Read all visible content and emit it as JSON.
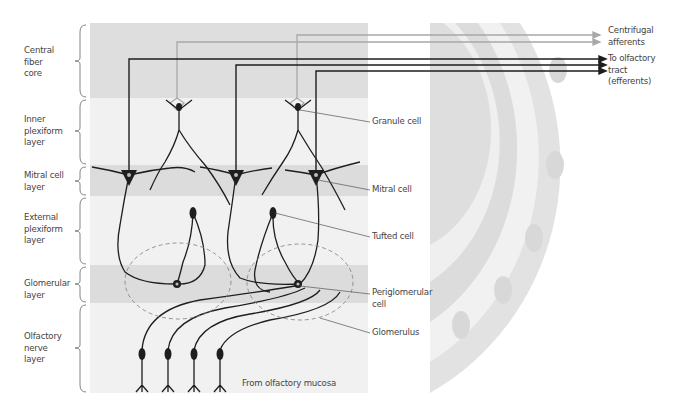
{
  "figure": {
    "colors": {
      "band_dark": "#dedede",
      "band_light": "#f1f1f1",
      "neuron": "#1e1e1e",
      "afferent": "#a8a8a8",
      "label": "#444444"
    }
  },
  "layers": [
    {
      "label": "Central\nfiber\ncore",
      "top": 23,
      "bottom": 98,
      "shade": "dark"
    },
    {
      "label": "Inner\nplexiform\nlayer",
      "top": 98,
      "bottom": 165,
      "shade": "light"
    },
    {
      "label": "Mitral cell\nlayer",
      "top": 165,
      "bottom": 196,
      "shade": "dark"
    },
    {
      "label": "External\nplexiform\nlayer",
      "top": 196,
      "bottom": 265,
      "shade": "light"
    },
    {
      "label": "Glomerular\nlayer",
      "top": 265,
      "bottom": 303,
      "shade": "dark"
    },
    {
      "label": "Olfactory\nnerve\nlayer",
      "top": 303,
      "bottom": 393,
      "shade": "light"
    }
  ],
  "callouts": {
    "granule_cell": "Granule cell",
    "mitral_cell": "Mitral cell",
    "tufted_cell": "Tufted cell",
    "periglomerular_cell": "Periglomerular\ncell",
    "glomerulus": "Glomerulus",
    "from_mucosa": "From olfactory mucosa"
  },
  "pathways": {
    "centrifugal": "Centrifugal\nafferents",
    "efferent": "To olfactory\ntract\n(efferents)"
  }
}
